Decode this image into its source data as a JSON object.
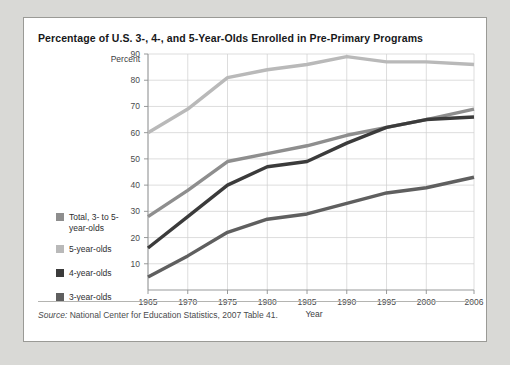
{
  "title": "Percentage of U.S. 3-, 4-, and 5-Year-Olds Enrolled in Pre-Primary Programs",
  "source": {
    "label": "Source:",
    "text": "National Center for Education Statistics, 2007 Table 41."
  },
  "colors": {
    "total": "#8e8e8e",
    "five": "#b9b9b9",
    "four": "#3b3b3b",
    "three": "#5f5f5f",
    "grid": "#cfcfcf",
    "axis": "#8d8e90",
    "card_background": "#ffffff",
    "page_background": "#d9d9d6"
  },
  "chart_data": {
    "type": "line",
    "title": "Percentage of U.S. 3-, 4-, and 5-Year-Olds Enrolled in Pre-Primary Programs",
    "xlabel": "Year",
    "ylabel": "Percent",
    "xlim": [
      1965,
      2006
    ],
    "ylim": [
      0,
      90
    ],
    "grid": true,
    "legend_position": "left-outside",
    "xticks": [
      1965,
      1970,
      1975,
      1980,
      1985,
      1990,
      1995,
      2000,
      2006
    ],
    "xtick_labels": [
      "1965",
      "1970",
      "1975",
      "1980",
      "1985",
      "1990",
      "1995",
      "2000",
      "2006"
    ],
    "yticks": [
      10,
      20,
      30,
      40,
      50,
      60,
      70,
      80,
      90
    ],
    "ytick_labels": [
      "10",
      "20",
      "30",
      "40",
      "50",
      "60",
      "70",
      "80",
      "90"
    ],
    "x": [
      1965,
      1970,
      1975,
      1980,
      1985,
      1990,
      1995,
      2000,
      2006
    ],
    "series": [
      {
        "name": "5-year-olds",
        "key": "five",
        "color": "#b9b9b9",
        "values": [
          60,
          69,
          81,
          84,
          86,
          89,
          87,
          87,
          86
        ]
      },
      {
        "name": "Total, 3- to 5-year-olds",
        "key": "total",
        "color": "#8e8e8e",
        "values": [
          28,
          38,
          49,
          52,
          55,
          59,
          62,
          65,
          69
        ]
      },
      {
        "name": "4-year-olds",
        "key": "four",
        "color": "#3b3b3b",
        "values": [
          16,
          28,
          40,
          47,
          49,
          56,
          62,
          65,
          66
        ]
      },
      {
        "name": "3-year-olds",
        "key": "three",
        "color": "#5f5f5f",
        "values": [
          5,
          13,
          22,
          27,
          29,
          33,
          37,
          39,
          43
        ]
      }
    ]
  },
  "legend": {
    "items": [
      {
        "label_line1": "Total, 3- to 5-",
        "label_line2": "year-olds",
        "color": "#8e8e8e",
        "key": "total"
      },
      {
        "label_line1": "5-year-olds",
        "label_line2": "",
        "color": "#b9b9b9",
        "key": "five"
      },
      {
        "label_line1": "4-year-olds",
        "label_line2": "",
        "color": "#3b3b3b",
        "key": "four"
      },
      {
        "label_line1": "3-year-olds",
        "label_line2": "",
        "color": "#5f5f5f",
        "key": "three"
      }
    ]
  }
}
